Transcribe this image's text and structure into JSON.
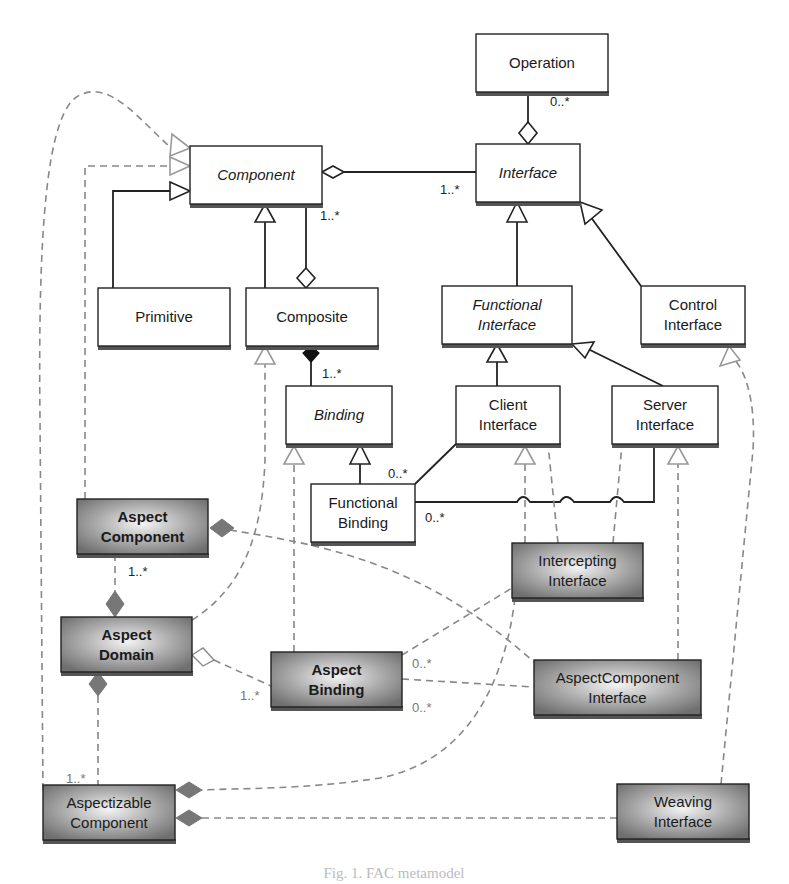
{
  "diagram": {
    "title": "FAC metamodel",
    "caption": "Fig. 1. FAC metamodel",
    "classes": [
      {
        "id": "operation",
        "label": [
          "Operation"
        ],
        "style": "plain",
        "x": 476,
        "y": 34,
        "w": 132,
        "h": 58
      },
      {
        "id": "component",
        "label": [
          "Component"
        ],
        "style": "abstract",
        "x": 190,
        "y": 146,
        "w": 132,
        "h": 58
      },
      {
        "id": "interface",
        "label": [
          "Interface"
        ],
        "style": "abstract",
        "x": 476,
        "y": 144,
        "w": 104,
        "h": 58
      },
      {
        "id": "primitive",
        "label": [
          "Primitive"
        ],
        "style": "plain",
        "x": 98,
        "y": 288,
        "w": 132,
        "h": 58
      },
      {
        "id": "composite",
        "label": [
          "Composite"
        ],
        "style": "plain",
        "x": 246,
        "y": 288,
        "w": 132,
        "h": 58
      },
      {
        "id": "functional-interface",
        "label": [
          "Functional",
          "Interface"
        ],
        "style": "abstract",
        "x": 442,
        "y": 286,
        "w": 130,
        "h": 58
      },
      {
        "id": "control-interface",
        "label": [
          "Control",
          "Interface"
        ],
        "style": "plain",
        "x": 641,
        "y": 286,
        "w": 104,
        "h": 58
      },
      {
        "id": "binding",
        "label": [
          "Binding"
        ],
        "style": "abstract",
        "x": 286,
        "y": 386,
        "w": 106,
        "h": 58
      },
      {
        "id": "client-interface",
        "label": [
          "Client",
          "Interface"
        ],
        "style": "plain",
        "x": 456,
        "y": 386,
        "w": 104,
        "h": 58
      },
      {
        "id": "server-interface",
        "label": [
          "Server",
          "Interface"
        ],
        "style": "plain",
        "x": 612,
        "y": 386,
        "w": 106,
        "h": 58
      },
      {
        "id": "functional-binding",
        "label": [
          "Functional",
          "Binding"
        ],
        "style": "plain",
        "x": 311,
        "y": 484,
        "w": 104,
        "h": 58
      },
      {
        "id": "aspect-component",
        "label": [
          "Aspect",
          "Component"
        ],
        "style": "aspect",
        "x": 77,
        "y": 499,
        "w": 131,
        "h": 55
      },
      {
        "id": "intercepting-interface",
        "label": [
          "Intercepting",
          "Interface"
        ],
        "style": "aspect",
        "x": 512,
        "y": 543,
        "w": 131,
        "h": 55
      },
      {
        "id": "aspect-domain",
        "label": [
          "Aspect",
          "Domain"
        ],
        "style": "aspect",
        "x": 61,
        "y": 617,
        "w": 131,
        "h": 55
      },
      {
        "id": "aspect-binding",
        "label": [
          "Aspect",
          "Binding"
        ],
        "style": "aspect",
        "x": 271,
        "y": 652,
        "w": 131,
        "h": 55
      },
      {
        "id": "aspectcomponent-interface",
        "label": [
          "AspectComponent",
          "Interface"
        ],
        "style": "aspect",
        "x": 534,
        "y": 660,
        "w": 167,
        "h": 55
      },
      {
        "id": "aspectizable-component",
        "label": [
          "Aspectizable",
          "Component"
        ],
        "style": "aspect",
        "x": 43,
        "y": 785,
        "w": 132,
        "h": 55
      },
      {
        "id": "weaving-interface",
        "label": [
          "Weaving",
          "Interface"
        ],
        "style": "aspect",
        "x": 617,
        "y": 784,
        "w": 132,
        "h": 55
      }
    ],
    "multiplicities": [
      {
        "text": "0..*",
        "x": 550,
        "y": 106,
        "tone": "dark"
      },
      {
        "text": "1..*",
        "x": 440,
        "y": 194,
        "tone": "dark"
      },
      {
        "text": "1..*",
        "x": 320,
        "y": 220,
        "tone": "dark"
      },
      {
        "text": "1..*",
        "x": 322,
        "y": 378,
        "tone": "dark"
      },
      {
        "text": "0..*",
        "x": 388,
        "y": 478,
        "tone": "dark"
      },
      {
        "text": "0..*",
        "x": 425,
        "y": 522,
        "tone": "dark"
      },
      {
        "text": "1..*",
        "x": 128,
        "y": 576,
        "tone": "dark"
      },
      {
        "text": "0..*",
        "x": 412,
        "y": 668,
        "tone": "grey"
      },
      {
        "text": "0..*",
        "x": 412,
        "y": 712,
        "tone": "grey"
      },
      {
        "text": "1..*",
        "x": 240,
        "y": 700,
        "tone": "grey"
      },
      {
        "text": "1..*",
        "x": 66,
        "y": 783,
        "tone": "grey"
      }
    ]
  }
}
